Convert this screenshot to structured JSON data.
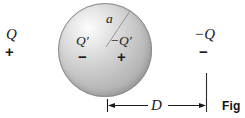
{
  "figure": {
    "type": "electrostatics-induced-charge-diagram",
    "caption": "Fig",
    "background_color": "#ffffff",
    "sphere": {
      "name": "conducting-sphere",
      "fill_light": "#fdfdfd",
      "fill_dark": "#9e9e9e",
      "outline_color": "#8d8d8d",
      "radius_label": "a"
    },
    "external_charges": [
      {
        "id": "left-charge",
        "symbol": "Q",
        "sign": "+"
      },
      {
        "id": "right-charge",
        "symbol": "−Q",
        "sign": "−"
      }
    ],
    "induced_charges": [
      {
        "id": "induced-left",
        "symbol": "Q′",
        "sign": "−"
      },
      {
        "id": "induced-right",
        "symbol": "−Q′",
        "sign": "+"
      }
    ],
    "dimension": {
      "id": "distance-D",
      "label": "D",
      "style": "double-arrow-with-end-ticks"
    }
  }
}
